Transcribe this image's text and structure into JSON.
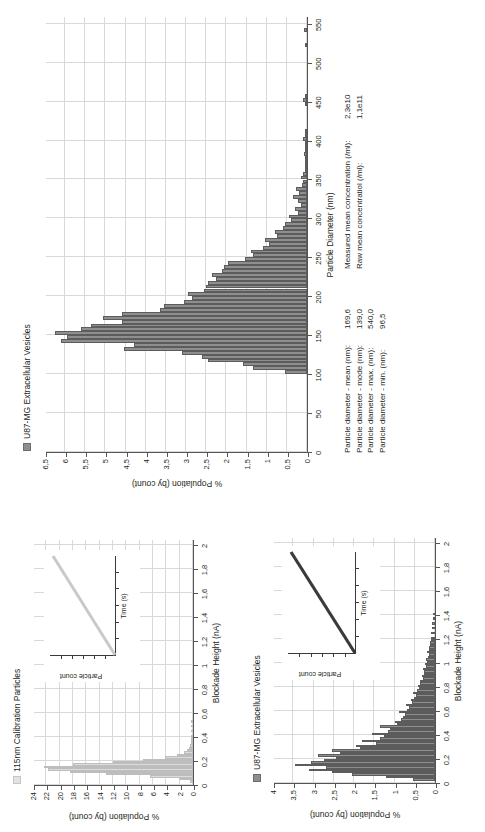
{
  "figure": {
    "orientation": "rotated-90-ccw",
    "colors": {
      "bar_fill": "#8e8e8e",
      "bar_edge": "#5c5c5c",
      "bar_fill_light": "#dcdcdc",
      "grid": "#d9d9d9",
      "axis": "#555555",
      "text": "#231f20"
    }
  },
  "panels": {
    "size_distribution": {
      "legend_label": "U87-MG Extracellular Vesicles",
      "legend_swatch": "dark-gray-square",
      "stats_left": {
        "rows": [
          {
            "label": "Particle diameter - mean (nm):",
            "value": "169,6"
          },
          {
            "label": "Particle diameter - mode (nm):",
            "value": "139,0"
          },
          {
            "label": "Particle diameter - max. (nm):",
            "value": "540,0"
          },
          {
            "label": "Particle diameter - min. (nm):",
            "value": "96,5"
          }
        ]
      },
      "stats_right": {
        "rows": [
          {
            "label": "Measured mean concentration (/ml):",
            "value": "2,3e10"
          },
          {
            "label": "Raw mean concentratiol (/ml):",
            "value": "1,1e11"
          }
        ]
      }
    },
    "calibration_blockade": {
      "legend_label": "115nm Calibration Particles",
      "legend_swatch": "light-gray-square",
      "inset": {
        "ylabel": "Particle count",
        "xlabel": "Time (s)"
      }
    },
    "ev_blockade": {
      "legend_label": "U87-MG Extracellular Vesicles",
      "legend_swatch": "dark-gray-square",
      "inset": {
        "ylabel": "Particle count",
        "xlabel": "Time (s)"
      }
    }
  },
  "chart_data": [
    {
      "id": "size-distribution",
      "type": "bar",
      "title": "",
      "xlabel": "Particle Diameter (nm)",
      "ylabel": "% Population (by count)",
      "xlim": [
        0,
        560
      ],
      "ylim": [
        0,
        6.5
      ],
      "xticks": [
        0,
        50,
        100,
        150,
        200,
        250,
        300,
        350,
        400,
        450,
        500,
        550
      ],
      "xticklabels": [
        "0",
        "50",
        "100",
        "150",
        "200",
        "250",
        "300",
        "350",
        "400",
        "450",
        "500",
        "550"
      ],
      "yticks": [
        0,
        0.5,
        1,
        1.5,
        2,
        2.5,
        3,
        3.5,
        4,
        4.5,
        5,
        5.5,
        6,
        6.5
      ],
      "yticklabels": [
        "0",
        "0,5",
        "1",
        "1,5",
        "2",
        "2,5",
        "3",
        "3,5",
        "4",
        "4,5",
        "5",
        "5,5",
        "6",
        "6,5"
      ],
      "grid": true,
      "legend": "U87-MG Extracellular Vesicles",
      "legend_position": "top-left",
      "bin_width": 5,
      "x": [
        100,
        105,
        110,
        115,
        120,
        125,
        130,
        135,
        140,
        145,
        150,
        155,
        160,
        165,
        170,
        175,
        180,
        185,
        190,
        195,
        200,
        205,
        210,
        215,
        220,
        225,
        230,
        235,
        240,
        245,
        250,
        255,
        260,
        265,
        270,
        275,
        280,
        285,
        290,
        295,
        300,
        305,
        310,
        315,
        320,
        325,
        330,
        335,
        340,
        345,
        350,
        355,
        360,
        365,
        370,
        375,
        380,
        385,
        390,
        395,
        400,
        405,
        410,
        445,
        450,
        455,
        520,
        540
      ],
      "values": [
        0.55,
        1.35,
        1.6,
        2.45,
        2.6,
        3.1,
        4.55,
        4.3,
        6.1,
        5.95,
        6.25,
        5.6,
        5.35,
        4.6,
        5.05,
        4.6,
        3.65,
        3.55,
        3.05,
        2.85,
        2.95,
        2.55,
        2.5,
        2.45,
        2.25,
        2.35,
        2.1,
        2.05,
        1.95,
        1.55,
        1.35,
        1.4,
        1.1,
        0.95,
        1.05,
        0.75,
        0.8,
        0.6,
        0.55,
        0.4,
        0.45,
        0.22,
        0.3,
        0.16,
        0.22,
        0.35,
        0.2,
        0.28,
        0.12,
        0.1,
        0.15,
        0.09,
        0.06,
        0.05,
        0.05,
        0.05,
        0.07,
        0.06,
        0.05,
        0.05,
        0.1,
        0.04,
        0.04,
        0.06,
        0.1,
        0.05,
        0.06,
        0.07
      ]
    },
    {
      "id": "calibration-blockade",
      "type": "bar",
      "title": "",
      "xlabel": "Blockade Height (nA)",
      "ylabel": "% Population (by count)",
      "xlim": [
        0,
        2.05
      ],
      "ylim": [
        0,
        24
      ],
      "xticks": [
        0,
        0.2,
        0.4,
        0.6,
        0.8,
        1.0,
        1.2,
        1.4,
        1.6,
        1.8,
        2.0
      ],
      "xticklabels": [
        "0",
        "0,2",
        "0,4",
        "0,6",
        "0,8",
        "1",
        "1,2",
        "1,4",
        "1,6",
        "1,8",
        "2"
      ],
      "yticks": [
        0,
        2,
        4,
        6,
        8,
        10,
        12,
        14,
        16,
        18,
        20,
        22,
        24
      ],
      "yticklabels": [
        "0",
        "2",
        "4",
        "6",
        "8",
        "10",
        "12",
        "14",
        "16",
        "18",
        "20",
        "22",
        "24"
      ],
      "grid": true,
      "legend": "115nm Calibration Particles",
      "legend_position": "top-left",
      "bin_width": 0.02,
      "x": [
        0.02,
        0.04,
        0.06,
        0.08,
        0.1,
        0.12,
        0.14,
        0.16,
        0.18,
        0.2,
        0.22,
        0.24,
        0.26,
        0.28,
        0.3,
        0.32,
        0.34,
        0.36,
        0.38,
        0.4,
        0.44,
        0.48,
        0.52
      ],
      "values": [
        0.4,
        2.1,
        6.5,
        13.0,
        18.5,
        21.8,
        22.3,
        18.0,
        12.0,
        7.5,
        4.2,
        2.4,
        1.4,
        0.9,
        0.6,
        0.4,
        0.3,
        0.25,
        0.2,
        0.15,
        0.1,
        0.08,
        0.05
      ],
      "inset": {
        "type": "line",
        "xlabel": "Time (s)",
        "ylabel": "Particle count",
        "trend": "linear-increasing"
      }
    },
    {
      "id": "ev-blockade",
      "type": "bar",
      "title": "",
      "xlabel": "Blockade Height (nA)",
      "ylabel": "% Population (by count)",
      "xlim": [
        0,
        2.05
      ],
      "ylim": [
        0,
        4
      ],
      "xticks": [
        0,
        0.2,
        0.4,
        0.6,
        0.8,
        1.0,
        1.2,
        1.4,
        1.6,
        1.8,
        2.0
      ],
      "xticklabels": [
        "0",
        "0,2",
        "0,4",
        "0,6",
        "0,8",
        "1",
        "1,2",
        "1,4",
        "1,6",
        "1,8",
        "2"
      ],
      "yticks": [
        0,
        0.5,
        1,
        1.5,
        2,
        2.5,
        3,
        3.5,
        4
      ],
      "yticklabels": [
        "0",
        "0,5",
        "1",
        "1,5",
        "2",
        "2,5",
        "3",
        "3,5",
        "4"
      ],
      "grid": true,
      "legend": "U87-MG Extracellular Vesicles",
      "legend_position": "top-left",
      "bin_width": 0.02,
      "x": [
        0.02,
        0.04,
        0.06,
        0.08,
        0.1,
        0.12,
        0.14,
        0.16,
        0.18,
        0.2,
        0.22,
        0.24,
        0.26,
        0.28,
        0.3,
        0.32,
        0.34,
        0.36,
        0.38,
        0.4,
        0.42,
        0.44,
        0.46,
        0.48,
        0.5,
        0.52,
        0.54,
        0.56,
        0.58,
        0.6,
        0.62,
        0.64,
        0.66,
        0.68,
        0.7,
        0.72,
        0.74,
        0.76,
        0.78,
        0.8,
        0.82,
        0.84,
        0.86,
        0.88,
        0.9,
        0.92,
        0.94,
        0.96,
        0.98,
        1.0,
        1.02,
        1.04,
        1.06,
        1.08,
        1.1,
        1.12,
        1.14,
        1.16,
        1.18,
        1.2,
        1.24,
        1.28,
        1.32,
        1.36,
        1.4
      ],
      "values": [
        0.55,
        1.2,
        2.05,
        2.55,
        3.1,
        2.7,
        3.45,
        3.05,
        2.75,
        2.45,
        2.9,
        2.35,
        2.55,
        1.85,
        1.95,
        1.45,
        1.8,
        1.35,
        1.25,
        1.55,
        1.15,
        1.1,
        1.35,
        0.95,
        1.0,
        0.85,
        0.8,
        0.75,
        0.9,
        0.7,
        0.65,
        0.72,
        0.58,
        0.6,
        0.52,
        0.48,
        0.55,
        0.45,
        0.4,
        0.42,
        0.36,
        0.38,
        0.3,
        0.32,
        0.28,
        0.26,
        0.3,
        0.22,
        0.24,
        0.2,
        0.22,
        0.18,
        0.16,
        0.19,
        0.14,
        0.15,
        0.12,
        0.13,
        0.1,
        0.11,
        0.09,
        0.08,
        0.07,
        0.06,
        0.05
      ],
      "inset": {
        "type": "line",
        "xlabel": "Time (s)",
        "ylabel": "Particle count",
        "trend": "linear-increasing"
      }
    }
  ]
}
